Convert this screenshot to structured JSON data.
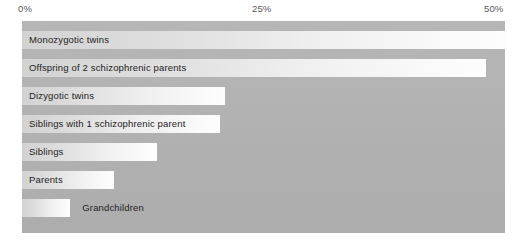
{
  "chart_data": {
    "type": "bar",
    "orientation": "horizontal",
    "title": "",
    "xlabel": "",
    "ylabel": "",
    "xlim": [
      0,
      50
    ],
    "grid": false,
    "legend": null,
    "tick_labels": [
      "0%",
      "25%",
      "50%"
    ],
    "ticks": [
      0,
      25,
      50
    ],
    "categories": [
      "Monozygotic twins",
      "Offspring of 2 schizophrenic parents",
      "Dizygotic twins",
      "Siblings with 1 schizophrenic parent",
      "Siblings",
      "Parents",
      "Grandchildren"
    ],
    "values": [
      50,
      48,
      21,
      20.5,
      14,
      9.5,
      5
    ],
    "bars": [
      {
        "label": "Monozygotic twins",
        "value": 50,
        "label_position": "inside"
      },
      {
        "label": "Offspring of 2 schizophrenic parents",
        "value": 48,
        "label_position": "inside"
      },
      {
        "label": "Dizygotic twins",
        "value": 21,
        "label_position": "inside"
      },
      {
        "label": "Siblings with 1 schizophrenic parent",
        "value": 20.5,
        "label_position": "inside"
      },
      {
        "label": "Siblings",
        "value": 14,
        "label_position": "inside"
      },
      {
        "label": "Parents",
        "value": 9.5,
        "label_position": "inside"
      },
      {
        "label": "Grandchildren",
        "value": 5,
        "label_position": "outside"
      }
    ]
  },
  "colors": {
    "panel_background": "#b2b2b2",
    "bar_start": "#d2d2d2",
    "bar_end": "#fbfbfb",
    "label_text": "#232323",
    "axis_text": "#58585a",
    "page_background": "#ffffff"
  }
}
